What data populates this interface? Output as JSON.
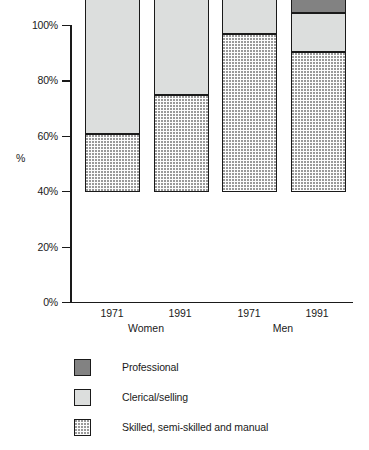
{
  "chart_data": {
    "type": "bar",
    "subtype": "stacked-percentage",
    "title": "",
    "xlabel": "",
    "ylabel": "%",
    "ylim": [
      0,
      100
    ],
    "grid": false,
    "legend_position": "bottom-left",
    "categories": [
      "1971",
      "1991",
      "1971",
      "1991"
    ],
    "groups": [
      {
        "name": "Women",
        "categories": [
          "1971",
          "1991"
        ]
      },
      {
        "name": "Men",
        "categories": [
          "1971",
          "1991"
        ]
      }
    ],
    "y_ticks": [
      "0%",
      "20%",
      "40%",
      "60%",
      "80%",
      "100%"
    ],
    "y_tick_values": [
      0,
      20,
      40,
      60,
      80,
      100
    ],
    "series": [
      {
        "name": "Skilled, semi-skilled and manual",
        "color": "#fdfdfd",
        "pattern": "stipple-dots",
        "values": [
          21,
          35,
          57,
          50.5
        ]
      },
      {
        "name": "Clerical/selling",
        "color": "#dcdedd",
        "pattern": "solid",
        "values": [
          63,
          42.5,
          19,
          14
        ]
      },
      {
        "name": "Professional",
        "color": "#828282",
        "pattern": "solid",
        "values": [
          16,
          22.5,
          24,
          35.5
        ]
      }
    ],
    "cumulative_tops": {
      "manual": [
        21,
        35,
        57,
        50.5
      ],
      "clerical": [
        84,
        77.5,
        76,
        64.5
      ],
      "professional": [
        100,
        100,
        100,
        100
      ]
    }
  },
  "legend": {
    "items": [
      {
        "label": "Professional",
        "icon": "swatch-professional"
      },
      {
        "label": "Clerical/selling",
        "icon": "swatch-clerical"
      },
      {
        "label": "Skilled, semi-skilled and manual",
        "icon": "swatch-manual"
      }
    ]
  },
  "axis": {
    "y_title": "%",
    "y_labels": [
      "100%",
      "80%",
      "60%",
      "40%",
      "20%",
      "0%"
    ],
    "x_labels": [
      "1971",
      "1991",
      "1971",
      "1991"
    ],
    "group_labels": [
      "Women",
      "Men"
    ]
  },
  "colors": {
    "professional": "#828282",
    "clerical": "#dcdedd",
    "manual": "#fdfdfd",
    "outline": "#1a1a1a",
    "background": "#ffffff"
  }
}
